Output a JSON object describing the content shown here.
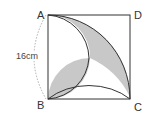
{
  "diagram": {
    "vertices": {
      "A": "A",
      "B": "B",
      "C": "C",
      "D": "D"
    },
    "side_length_label": "16cm",
    "colors": {
      "shade": "#c8c8c8",
      "stroke": "#333333",
      "dashed": "#999999"
    }
  }
}
